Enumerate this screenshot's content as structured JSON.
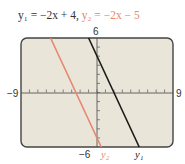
{
  "title": {
    "eq1_label": "y₁ = −2x + 4,",
    "eq2_label": "y₂ = −2x − 5"
  },
  "axis_labels": {
    "xmin": "−9",
    "xmax": "9",
    "ymin": "−6",
    "ymax": "6"
  },
  "series_labels": {
    "y1": "y₁",
    "y2": "y₂"
  },
  "colors": {
    "y1": "#1a1a1a",
    "y2": "#e8866f",
    "screen_bg": "#e9e5d9",
    "frame": "#444444"
  },
  "chart_data": {
    "type": "line",
    "xlabel": "",
    "ylabel": "",
    "xlim": [
      -9,
      9
    ],
    "ylim": [
      -6,
      6
    ],
    "xticks_step": 1,
    "yticks_step": 1,
    "grid": false,
    "legend_position": "inline labels at bottom of lines",
    "series": [
      {
        "name": "y1",
        "equation": "y = -2x + 4",
        "slope": -2,
        "intercept": 4,
        "x": [
          -1,
          5
        ],
        "y": [
          6,
          -6
        ],
        "color": "#1a1a1a"
      },
      {
        "name": "y2",
        "equation": "y = -2x - 5",
        "slope": -2,
        "intercept": -5,
        "x": [
          -5.5,
          0.5
        ],
        "y": [
          6,
          -6
        ],
        "color": "#e8866f"
      }
    ]
  }
}
